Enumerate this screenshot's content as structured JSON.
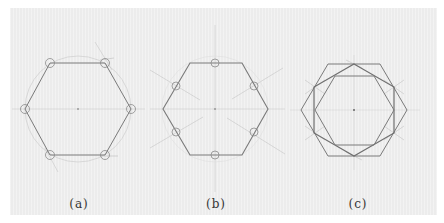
{
  "colors": {
    "paper": "#ececec",
    "construction_line": "#c4c4c4",
    "hexagon_line": "#7a7a7a",
    "circle_mark": "#8a8a8a",
    "center_dot": "#666666",
    "label_text": "#333333"
  },
  "panels": [
    {
      "id": "a",
      "label": "(a)",
      "description": "Hexagon inscribed in circle with circled vertices",
      "center": [
        78,
        109
      ],
      "radius": 53,
      "hexagon_points": "50,63 105,63 131,109 105,155 50,155 25,109",
      "vertex_marks": [
        [
          50,
          63
        ],
        [
          105,
          63
        ],
        [
          131,
          109
        ],
        [
          105,
          155
        ],
        [
          50,
          155
        ],
        [
          25,
          109
        ]
      ]
    },
    {
      "id": "b",
      "label": "(b)",
      "description": "Hexagon with circled edge midpoints and radial construction lines",
      "center": [
        215,
        109
      ],
      "hexagon_points": "190,63 242,63 268,109 242,155 190,155 163,109",
      "midpoint_marks": [
        [
          215,
          63
        ],
        [
          254,
          86
        ],
        [
          254,
          132
        ],
        [
          215,
          155
        ],
        [
          176,
          132
        ],
        [
          176,
          86
        ]
      ]
    },
    {
      "id": "c",
      "label": "(c)",
      "description": "Nested hexagons: outer flat-top, rotated pointy-top, inner flat-top",
      "center": [
        354,
        110
      ],
      "outer_hexagon_points": "328,64 380,64 407,110 380,156 328,156 301,110",
      "rotated_hexagon_points": "354,64 394,87 394,133 354,156 314,133 314,87",
      "inner_hexagon_points": "335,76 374,76 394,110 374,145 335,145 315,110"
    }
  ]
}
